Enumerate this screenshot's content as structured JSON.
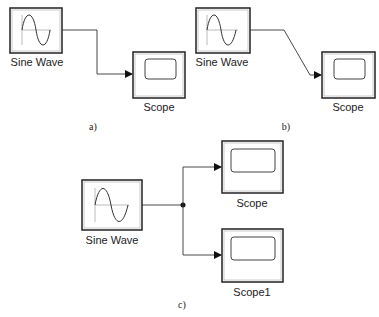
{
  "panels": {
    "a": {
      "caption": "a)",
      "source": {
        "label": "Sine Wave",
        "type": "sine-wave-block"
      },
      "sink": {
        "label": "Scope",
        "type": "scope-block"
      },
      "connection": "orthogonal"
    },
    "b": {
      "caption": "b)",
      "source": {
        "label": "Sine Wave",
        "type": "sine-wave-block"
      },
      "sink": {
        "label": "Scope",
        "type": "scope-block"
      },
      "connection": "diagonal"
    },
    "c": {
      "caption": "c)",
      "source": {
        "label": "Sine Wave",
        "type": "sine-wave-block"
      },
      "sinks": [
        {
          "label": "Scope",
          "type": "scope-block"
        },
        {
          "label": "Scope1",
          "type": "scope-block"
        }
      ],
      "connection": "branched"
    }
  },
  "colors": {
    "line": "#333333",
    "block_border": "#222222",
    "background": "#ffffff"
  }
}
